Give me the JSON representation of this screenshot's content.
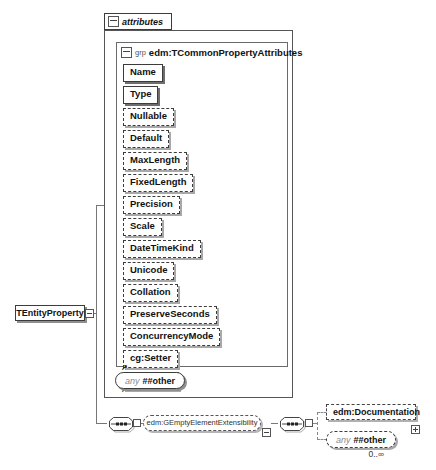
{
  "diagram": {
    "root_element": {
      "label": "TEntityProperty"
    },
    "attributes_panel": {
      "tab_label": "attributes",
      "group": {
        "kind_label": "grp",
        "title": "edm:TCommonPropertyAttributes",
        "attributes": [
          {
            "label": "Name",
            "required": true,
            "icon": false
          },
          {
            "label": "Type",
            "required": true,
            "icon": false
          },
          {
            "label": "Nullable",
            "required": false,
            "icon": false
          },
          {
            "label": "Default",
            "required": false,
            "icon": false
          },
          {
            "label": "MaxLength",
            "required": false,
            "icon": false
          },
          {
            "label": "FixedLength",
            "required": false,
            "icon": false
          },
          {
            "label": "Precision",
            "required": false,
            "icon": false
          },
          {
            "label": "Scale",
            "required": false,
            "icon": false
          },
          {
            "label": "DateTimeKind",
            "required": false,
            "icon": false
          },
          {
            "label": "Unicode",
            "required": false,
            "icon": false
          },
          {
            "label": "Collation",
            "required": false,
            "icon": false
          },
          {
            "label": "PreserveSeconds",
            "required": false,
            "icon": false
          },
          {
            "label": "ConcurrencyMode",
            "required": false,
            "icon": false
          },
          {
            "label": "cg:Setter",
            "required": false,
            "icon": true
          },
          {
            "label": "cg:Getter",
            "required": false,
            "icon": true
          }
        ]
      },
      "any_attribute": {
        "prefix": "any",
        "label": "##other"
      }
    },
    "content_model": {
      "group_ref_label": "edm:GEmptyElementExtensibility",
      "documentation": {
        "label": "edm:Documentation"
      },
      "any_element": {
        "prefix": "any",
        "label": "##other",
        "occurs": "0..∞"
      }
    }
  },
  "icons": {
    "external_attribute": "↗"
  },
  "colors": {
    "ink": "#111",
    "line": "#777",
    "border": "#3c3c3c",
    "background": "#ffffff"
  }
}
